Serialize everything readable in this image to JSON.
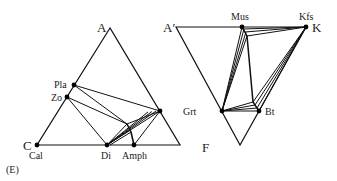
{
  "panel_label": "(E)",
  "left_diagram": {
    "name": "ACF-style ternary (Ca-rich)",
    "apex_labels": {
      "top": "A",
      "bottom_left": "C"
    },
    "phases": [
      "Pla",
      "Zo",
      "Cal",
      "Di",
      "Amph"
    ]
  },
  "right_diagram": {
    "name": "A'KF ternary",
    "apex_labels": {
      "top_left": "A′",
      "top_right": "K",
      "bottom": "F"
    },
    "phases": [
      "Mus",
      "Kfs",
      "Grt",
      "Bt"
    ]
  },
  "colors": {
    "ink": "#111111",
    "background": "#ffffff"
  }
}
